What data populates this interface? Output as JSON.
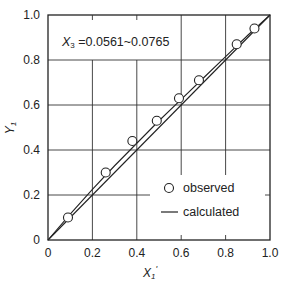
{
  "chart_data": {
    "type": "scatter",
    "title": "",
    "annotation": "X₃ = 0.0561~0.0765",
    "annotation_var": "X",
    "annotation_sub": "3",
    "annotation_rest": " =0.0561~0.0765",
    "xlabel": "X₁'",
    "xlabel_main": "X",
    "xlabel_sub": "1",
    "xlabel_prime": "'",
    "ylabel": "Y₁",
    "ylabel_main": "Y",
    "ylabel_sub": "1",
    "xlim": [
      0,
      1.0
    ],
    "ylim": [
      0,
      1.0
    ],
    "xticks": [
      "0",
      "0.2",
      "0.4",
      "0.6",
      "0.8",
      "1.0"
    ],
    "yticks": [
      "0",
      "0.2",
      "0.4",
      "0.6",
      "0.8",
      "1.0"
    ],
    "grid": true,
    "legend_position": "lower right",
    "series": [
      {
        "name": "observed",
        "marker": "open-circle",
        "x": [
          0.09,
          0.26,
          0.38,
          0.49,
          0.59,
          0.68,
          0.85,
          0.93
        ],
        "y": [
          0.1,
          0.3,
          0.44,
          0.53,
          0.63,
          0.71,
          0.87,
          0.94
        ]
      },
      {
        "name": "calculated",
        "marker": "line",
        "x": [
          0.0,
          0.1,
          0.2,
          0.3,
          0.4,
          0.5,
          0.6,
          0.7,
          0.8,
          0.9,
          1.0
        ],
        "y": [
          0.0,
          0.115,
          0.225,
          0.33,
          0.43,
          0.53,
          0.625,
          0.72,
          0.815,
          0.91,
          1.0
        ]
      },
      {
        "name": "diagonal",
        "marker": "line",
        "x": [
          0.0,
          1.0
        ],
        "y": [
          0.0,
          1.0
        ]
      }
    ]
  },
  "legend": {
    "observed": "observed",
    "calculated": "calculated"
  }
}
